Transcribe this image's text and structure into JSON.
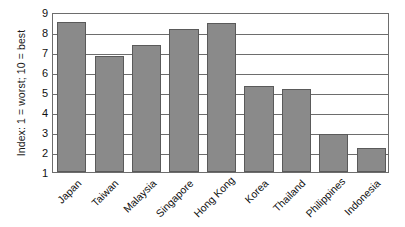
{
  "chart_data": {
    "type": "bar",
    "title": "",
    "xlabel": "",
    "ylabel": "Index: 1 = worst; 10 = best",
    "ylim": [
      1,
      9
    ],
    "yticks": [
      9,
      8,
      7,
      6,
      5,
      4,
      3,
      2,
      1
    ],
    "grid": true,
    "legend": "none",
    "bar_color": "#8a8a8a",
    "bar_edge_color": "#5a5a5a",
    "axis_color": "#6d6d6d",
    "categories": [
      "Japan",
      "Taiwan",
      "Malaysia",
      "Singapore",
      "Hong Kong",
      "Korea",
      "Thailand",
      "Philippines",
      "Indonesia"
    ],
    "values": [
      8.5,
      6.8,
      7.35,
      8.15,
      8.45,
      5.3,
      5.15,
      2.9,
      2.2
    ]
  }
}
